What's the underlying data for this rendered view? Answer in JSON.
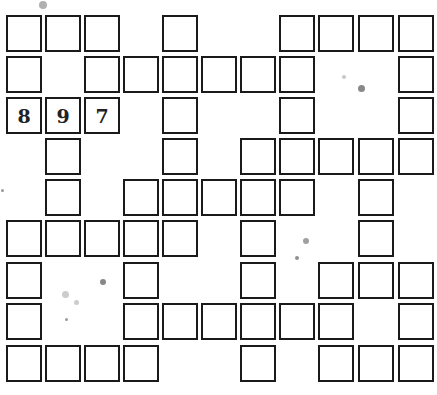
{
  "puzzle": {
    "type": "number-fill-in crossword",
    "rows": 9,
    "cols": 11,
    "col_x": [
      6,
      45,
      84,
      123,
      162,
      201,
      240,
      279,
      318,
      358,
      398
    ],
    "row_y": [
      15,
      56,
      97,
      138,
      179,
      220,
      262,
      303,
      345
    ],
    "grid": [
      [
        {
          "c": 0
        },
        {
          "c": 1
        },
        {
          "c": 2
        },
        {
          "c": 4
        },
        {
          "c": 7
        },
        {
          "c": 8
        },
        {
          "c": 9
        },
        {
          "c": 10
        }
      ],
      [
        {
          "c": 0
        },
        {
          "c": 2
        },
        {
          "c": 3
        },
        {
          "c": 4
        },
        {
          "c": 5
        },
        {
          "c": 6
        },
        {
          "c": 7
        },
        {
          "c": 10
        }
      ],
      [
        {
          "c": 0,
          "v": "8"
        },
        {
          "c": 1,
          "v": "9"
        },
        {
          "c": 2,
          "v": "7"
        },
        {
          "c": 4
        },
        {
          "c": 7
        },
        {
          "c": 10
        }
      ],
      [
        {
          "c": 1
        },
        {
          "c": 4
        },
        {
          "c": 6
        },
        {
          "c": 7
        },
        {
          "c": 8
        },
        {
          "c": 9
        },
        {
          "c": 10
        }
      ],
      [
        {
          "c": 1
        },
        {
          "c": 3
        },
        {
          "c": 4
        },
        {
          "c": 5
        },
        {
          "c": 6
        },
        {
          "c": 7
        },
        {
          "c": 9
        }
      ],
      [
        {
          "c": 0
        },
        {
          "c": 1
        },
        {
          "c": 2
        },
        {
          "c": 3
        },
        {
          "c": 4
        },
        {
          "c": 6
        },
        {
          "c": 9
        }
      ],
      [
        {
          "c": 0
        },
        {
          "c": 3
        },
        {
          "c": 6
        },
        {
          "c": 8
        },
        {
          "c": 9
        },
        {
          "c": 10
        }
      ],
      [
        {
          "c": 0
        },
        {
          "c": 3
        },
        {
          "c": 4
        },
        {
          "c": 5
        },
        {
          "c": 6
        },
        {
          "c": 7
        },
        {
          "c": 8
        },
        {
          "c": 10
        }
      ],
      [
        {
          "c": 0
        },
        {
          "c": 1
        },
        {
          "c": 2
        },
        {
          "c": 3
        },
        {
          "c": 6
        },
        {
          "c": 8
        },
        {
          "c": 9
        },
        {
          "c": 10
        }
      ]
    ]
  },
  "specks": [
    {
      "x": 43,
      "y": 5,
      "r": 4,
      "color": "#b0b0b0"
    },
    {
      "x": 344,
      "y": 77,
      "r": 2,
      "color": "#c8c8c8"
    },
    {
      "x": 361,
      "y": 88,
      "r": 3.5,
      "color": "#888888"
    },
    {
      "x": 2,
      "y": 190,
      "r": 1.5,
      "color": "#999999"
    },
    {
      "x": 306,
      "y": 241,
      "r": 3,
      "color": "#a0a0a0"
    },
    {
      "x": 297,
      "y": 258,
      "r": 2,
      "color": "#909090"
    },
    {
      "x": 103,
      "y": 282,
      "r": 3,
      "color": "#888888"
    },
    {
      "x": 65,
      "y": 294,
      "r": 3.5,
      "color": "#cccccc"
    },
    {
      "x": 76,
      "y": 302,
      "r": 2.5,
      "color": "#cccccc"
    },
    {
      "x": 66,
      "y": 319,
      "r": 1.5,
      "color": "#999999"
    }
  ]
}
